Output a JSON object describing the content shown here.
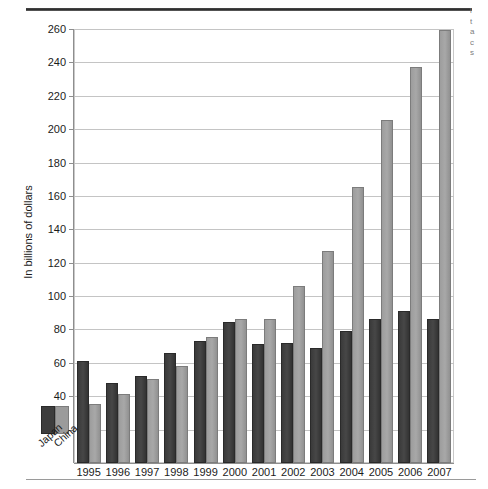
{
  "chart_data": {
    "type": "bar",
    "title": "",
    "subtitle": "",
    "xlabel": "",
    "ylabel": "In billions of dollars",
    "ylim": [
      0,
      260
    ],
    "ytick_step": 20,
    "yticks": [
      20,
      40,
      60,
      80,
      100,
      120,
      140,
      160,
      180,
      200,
      220,
      240,
      260
    ],
    "grid": true,
    "legend_position": "bottom-left-outside",
    "categories": [
      "1995",
      "1996",
      "1997",
      "1998",
      "1999",
      "2000",
      "2001",
      "2002",
      "2003",
      "2004",
      "2005",
      "2006",
      "2007"
    ],
    "series": [
      {
        "name": "Japan",
        "color": "#3d3d3d",
        "values": [
          60,
          47,
          51,
          65,
          72,
          83,
          70,
          71,
          68,
          78,
          85,
          90,
          85
        ]
      },
      {
        "name": "China",
        "color": "#9b9b9b",
        "values": [
          34,
          40,
          49,
          57,
          74,
          85,
          85,
          105,
          126,
          164,
          204,
          236,
          258
        ]
      }
    ]
  },
  "legend": {
    "japan_label": "Japan",
    "china_label": "China"
  },
  "right_margin_text": {
    "lines": [
      "l",
      "t",
      "a",
      "c",
      "s"
    ]
  }
}
